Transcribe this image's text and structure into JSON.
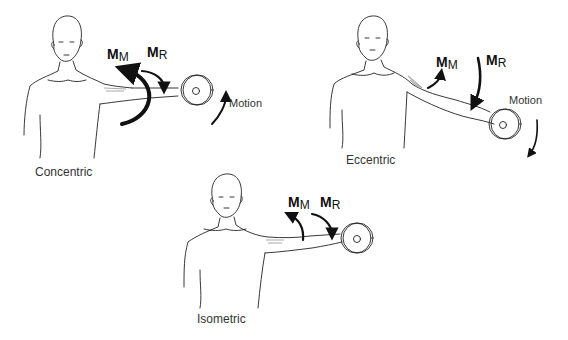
{
  "figure": {
    "panels": [
      {
        "id": "concentric",
        "caption": "Concentric",
        "muscle_moment": {
          "symbol": "M",
          "subscript": "M"
        },
        "resistance_moment": {
          "symbol": "M",
          "subscript": "R"
        },
        "motion_label": "Motion",
        "motion_direction": "upward"
      },
      {
        "id": "eccentric",
        "caption": "Eccentric",
        "muscle_moment": {
          "symbol": "M",
          "subscript": "M"
        },
        "resistance_moment": {
          "symbol": "M",
          "subscript": "R"
        },
        "motion_label": "Motion",
        "motion_direction": "downward"
      },
      {
        "id": "isometric",
        "caption": "Isometric",
        "muscle_moment": {
          "symbol": "M",
          "subscript": "M"
        },
        "resistance_moment": {
          "symbol": "M",
          "subscript": "R"
        }
      }
    ],
    "colors": {
      "line": "#222222",
      "arrow": "#111111",
      "muscle_shading": "#aaaaaa",
      "text": "#333333",
      "background": "#ffffff"
    }
  }
}
